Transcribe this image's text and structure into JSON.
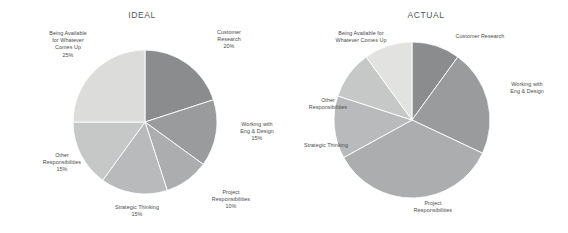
{
  "figure": {
    "background": "#ffffff",
    "label_color": "#4a4a4c",
    "title_color": "#55565a"
  },
  "chart_data": [
    {
      "type": "pie",
      "title": "IDEAL",
      "position": "left",
      "show_percent_labels": true,
      "start_angle_deg": 0,
      "direction": "clockwise",
      "categories": [
        "Customer Research",
        "Working with Eng & Design",
        "Project Responsibilities",
        "Strategic Thinking",
        "Other Responsibilities",
        "Being Available for Whatever Comes Up"
      ],
      "values": [
        20,
        15,
        10,
        15,
        15,
        25
      ],
      "value_labels": [
        "20%",
        "15%",
        "10%",
        "15%",
        "15%",
        "25%"
      ],
      "colors": [
        "#8b8c8e",
        "#9a9b9d",
        "#acadaf",
        "#b9babb",
        "#c6c7c7",
        "#dcdcdb"
      ],
      "legend": "none",
      "grid": false
    },
    {
      "type": "pie",
      "title": "ACTUAL",
      "position": "right",
      "show_percent_labels": false,
      "start_angle_deg": 0,
      "direction": "clockwise",
      "categories": [
        "Customer Research",
        "Working with Eng & Design",
        "Project Responsibilities",
        "Strategic Thinking",
        "Other Responsibilities",
        "Being Available for Whatever Comes Up"
      ],
      "values": [
        10,
        22,
        35,
        13,
        10,
        10
      ],
      "value_labels": [
        "",
        "",
        "",
        "",
        "",
        ""
      ],
      "colors": [
        "#8b8c8e",
        "#9a9b9d",
        "#acadaf",
        "#b9babb",
        "#c6c7c7",
        "#e2e2e0"
      ],
      "legend": "none",
      "grid": false
    }
  ],
  "ideal": {
    "title": "IDEAL",
    "labels": {
      "being_available": {
        "line1": "Being Available",
        "line2": "for Whatever",
        "line3": "Comes Up",
        "pct": "25%"
      },
      "customer_research": {
        "line1": "Customer",
        "line2": "Research",
        "pct": "20%"
      },
      "eng_design": {
        "line1": "Working with",
        "line2": "Eng & Design",
        "pct": "15%"
      },
      "project_responsibilities": {
        "line1": "Project",
        "line2": "Responsibilities",
        "pct": "10%"
      },
      "strategic_thinking": {
        "line1": "Strategic Thinking",
        "pct": "15%"
      },
      "other_responsibilities": {
        "line1": "Other",
        "line2": "Responsibilities",
        "pct": "15%"
      }
    }
  },
  "actual": {
    "title": "ACTUAL",
    "labels": {
      "being_available": {
        "line1": "Being Available for",
        "line2": "Whatever Comes Up"
      },
      "customer_research": {
        "line1": "Customer Research"
      },
      "eng_design": {
        "line1": "Working with",
        "line2": "Eng & Design"
      },
      "project_responsibilities": {
        "line1": "Project",
        "line2": "Responsibilities"
      },
      "strategic_thinking": {
        "line1": "Strategic Thinking"
      },
      "other_responsibilities": {
        "line1": "Other",
        "line2": "Responsibilities"
      }
    }
  }
}
